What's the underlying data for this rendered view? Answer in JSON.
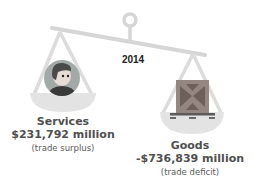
{
  "year": "2014",
  "services": {
    "title": "Services",
    "amount": "$231,792 million",
    "note": "(trade surplus)",
    "icon": "person-avatar-icon"
  },
  "goods": {
    "title": "Goods",
    "amount": "-$736,839 million",
    "note": "(trade deficit)",
    "icon": "shipping-crate-icon"
  },
  "colors": {
    "scale": "#d9d9d9",
    "text": "#4f4f4f",
    "avatar_bg": "#9aa3a0",
    "crate": "#8f8079"
  }
}
